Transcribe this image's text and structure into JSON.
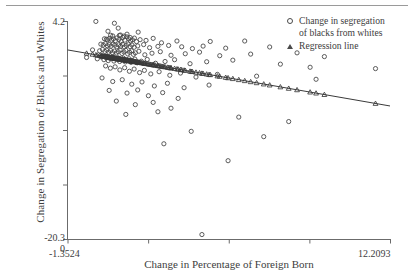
{
  "chart_data": {
    "type": "scatter",
    "title": "",
    "xlabel": "Change in Percentage of Foreign Born",
    "ylabel": "Change in Segregation of Blacks and Whites",
    "xlim": [
      -1.3524,
      12.2093
    ],
    "ylim": [
      -20.3,
      4.2
    ],
    "x_tick_labels": [
      "-1.3524",
      "12.2093"
    ],
    "y_tick_labels": [
      "4.2",
      "-20.3"
    ],
    "origin_label": "0",
    "grid": false,
    "legend_position": "top-right",
    "series": [
      {
        "name": "Change in segregation of blacks from whites",
        "marker": "circle",
        "points": [
          [
            -0.16,
            4.15
          ],
          [
            0.62,
            3.95
          ],
          [
            0.78,
            3.4
          ],
          [
            0.35,
            3.05
          ],
          [
            1.62,
            2.95
          ],
          [
            0.46,
            2.6
          ],
          [
            0.55,
            2.52
          ],
          [
            0.83,
            2.58
          ],
          [
            0.88,
            2.62
          ],
          [
            1.02,
            2.5
          ],
          [
            1.15,
            2.72
          ],
          [
            1.28,
            2.35
          ],
          [
            0.2,
            2.2
          ],
          [
            0.28,
            2.15
          ],
          [
            0.33,
            2.1
          ],
          [
            0.41,
            2.25
          ],
          [
            0.5,
            2.05
          ],
          [
            0.58,
            2.18
          ],
          [
            0.66,
            1.98
          ],
          [
            0.73,
            2.3
          ],
          [
            0.81,
            2.12
          ],
          [
            0.9,
            1.9
          ],
          [
            0.98,
            2.35
          ],
          [
            1.06,
            2.05
          ],
          [
            1.14,
            2.42
          ],
          [
            1.22,
            2.2
          ],
          [
            1.3,
            1.95
          ],
          [
            1.38,
            2.08
          ],
          [
            1.46,
            2.28
          ],
          [
            1.55,
            1.88
          ],
          [
            1.7,
            2.1
          ],
          [
            1.95,
            2.02
          ],
          [
            2.25,
            2.25
          ],
          [
            2.6,
            1.75
          ],
          [
            3.25,
            1.95
          ],
          [
            4.65,
            1.9
          ],
          [
            6.1,
            1.95
          ],
          [
            0.05,
            1.6
          ],
          [
            0.15,
            1.5
          ],
          [
            0.24,
            1.65
          ],
          [
            0.32,
            1.42
          ],
          [
            0.4,
            1.55
          ],
          [
            0.48,
            1.38
          ],
          [
            0.56,
            1.6
          ],
          [
            0.64,
            1.48
          ],
          [
            0.72,
            1.3
          ],
          [
            0.8,
            1.52
          ],
          [
            0.88,
            1.35
          ],
          [
            0.96,
            1.58
          ],
          [
            1.04,
            1.28
          ],
          [
            1.12,
            1.45
          ],
          [
            1.2,
            1.62
          ],
          [
            1.28,
            1.32
          ],
          [
            1.36,
            1.5
          ],
          [
            1.45,
            1.25
          ],
          [
            1.6,
            1.4
          ],
          [
            1.85,
            1.55
          ],
          [
            2.1,
            1.2
          ],
          [
            2.45,
            1.35
          ],
          [
            2.9,
            1.45
          ],
          [
            3.45,
            1.3
          ],
          [
            3.9,
            1.1
          ],
          [
            4.35,
            1.38
          ],
          [
            5.3,
            1.15
          ],
          [
            7.15,
            1.28
          ],
          [
            -0.3,
            0.95
          ],
          [
            0.0,
            0.85
          ],
          [
            0.12,
            1.0
          ],
          [
            0.22,
            0.78
          ],
          [
            0.3,
            0.92
          ],
          [
            0.38,
            0.7
          ],
          [
            0.46,
            0.88
          ],
          [
            0.54,
            0.65
          ],
          [
            0.62,
            0.82
          ],
          [
            0.7,
            0.6
          ],
          [
            0.78,
            0.75
          ],
          [
            0.86,
            0.95
          ],
          [
            0.94,
            0.55
          ],
          [
            1.02,
            0.72
          ],
          [
            1.1,
            0.9
          ],
          [
            1.18,
            0.5
          ],
          [
            1.26,
            0.68
          ],
          [
            1.34,
            0.85
          ],
          [
            1.42,
            0.45
          ],
          [
            1.5,
            0.62
          ],
          [
            1.65,
            0.8
          ],
          [
            1.9,
            0.4
          ],
          [
            2.2,
            0.58
          ],
          [
            2.55,
            0.75
          ],
          [
            3.0,
            0.35
          ],
          [
            3.6,
            0.52
          ],
          [
            4.2,
            0.7
          ],
          [
            5.05,
            0.3
          ],
          [
            6.35,
            0.48
          ],
          [
            8.3,
            0.62
          ],
          [
            9.45,
            0.2
          ],
          [
            -0.55,
            0.1
          ],
          [
            -0.1,
            -0.05
          ],
          [
            0.08,
            0.15
          ],
          [
            0.18,
            -0.15
          ],
          [
            0.28,
            0.05
          ],
          [
            0.36,
            -0.25
          ],
          [
            0.44,
            -0.02
          ],
          [
            0.52,
            0.18
          ],
          [
            0.6,
            -0.3
          ],
          [
            0.68,
            -0.1
          ],
          [
            0.76,
            0.08
          ],
          [
            0.84,
            -0.35
          ],
          [
            0.92,
            -0.18
          ],
          [
            1.0,
            0.02
          ],
          [
            1.08,
            -0.4
          ],
          [
            1.16,
            -0.22
          ],
          [
            1.24,
            -0.05
          ],
          [
            1.32,
            -0.45
          ],
          [
            1.4,
            -0.28
          ],
          [
            1.48,
            -0.08
          ],
          [
            1.58,
            -0.5
          ],
          [
            1.75,
            -0.32
          ],
          [
            2.0,
            -0.12
          ],
          [
            2.35,
            -0.55
          ],
          [
            2.75,
            -0.35
          ],
          [
            3.15,
            -0.15
          ],
          [
            3.8,
            -0.6
          ],
          [
            4.5,
            -0.38
          ],
          [
            5.6,
            -0.2
          ],
          [
            7.6,
            -0.65
          ],
          [
            8.85,
            -1.0
          ],
          [
            11.6,
            -1.15
          ],
          [
            0.25,
            -0.85
          ],
          [
            0.45,
            -1.1
          ],
          [
            0.65,
            -0.95
          ],
          [
            0.85,
            -1.3
          ],
          [
            1.05,
            -1.05
          ],
          [
            1.25,
            -1.45
          ],
          [
            1.45,
            -1.2
          ],
          [
            1.68,
            -1.6
          ],
          [
            1.88,
            -1.35
          ],
          [
            2.15,
            -1.75
          ],
          [
            2.5,
            -1.5
          ],
          [
            2.95,
            -1.9
          ],
          [
            3.4,
            -1.65
          ],
          [
            4.05,
            -2.1
          ],
          [
            4.95,
            -1.8
          ],
          [
            6.6,
            -2.0
          ],
          [
            9.1,
            -2.35
          ],
          [
            0.1,
            -2.2
          ],
          [
            0.55,
            -2.6
          ],
          [
            0.95,
            -2.4
          ],
          [
            1.35,
            -2.9
          ],
          [
            1.78,
            -2.65
          ],
          [
            2.3,
            -3.1
          ],
          [
            2.85,
            -2.8
          ],
          [
            3.55,
            -3.3
          ],
          [
            4.6,
            -3.0
          ],
          [
            0.4,
            -3.6
          ],
          [
            1.15,
            -3.9
          ],
          [
            1.6,
            -3.55
          ],
          [
            2.05,
            -4.2
          ],
          [
            2.65,
            -3.85
          ],
          [
            3.3,
            -4.5
          ],
          [
            0.7,
            -4.8
          ],
          [
            1.5,
            -5.2
          ],
          [
            2.25,
            -4.95
          ],
          [
            3.0,
            -5.6
          ],
          [
            1.1,
            -6.3
          ],
          [
            2.45,
            -6.0
          ],
          [
            5.85,
            -6.6
          ],
          [
            7.95,
            -7.1
          ],
          [
            3.85,
            -8.2
          ],
          [
            6.9,
            -8.8
          ],
          [
            2.7,
            -9.6
          ],
          [
            5.4,
            -11.5
          ],
          [
            4.3,
            -19.8
          ]
        ]
      },
      {
        "name": "Regression line",
        "marker": "triangle",
        "line": true,
        "endpoints": [
          [
            -1.3524,
            0.95
          ],
          [
            12.2093,
            -5.35
          ]
        ]
      }
    ],
    "legend": [
      {
        "label": "Change in segregation of blacks from whites",
        "label_line1": "Change in segregation",
        "label_line2": "of blacks from whites",
        "marker": "circle"
      },
      {
        "label": "Regression line",
        "label_line1": "Regression line",
        "marker": "triangle"
      }
    ],
    "colors": {
      "marker": "#4a4a4a",
      "line": "#3a3a3a",
      "axis": "#6b6b6b",
      "text": "#3d3d3d"
    }
  },
  "axes": {
    "y_title": "Change in Segregation of Blacks and Whites",
    "x_title": "Change in Percentage of Foreign Born",
    "y_max_label": "4.2",
    "y_min_label": "-20.3",
    "origin_label": "0",
    "x_min_label": "-1.3524",
    "x_max_label": "12.2093"
  }
}
